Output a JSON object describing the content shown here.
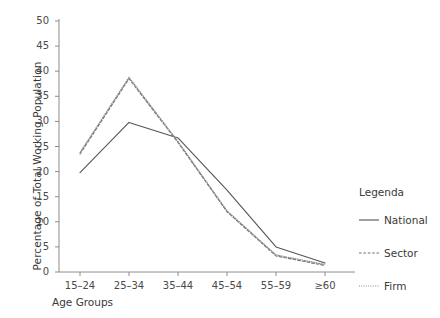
{
  "chart_data": {
    "type": "line",
    "title": "",
    "xlabel": "Age Groups",
    "ylabel": "Percentage of Total Working Population",
    "categories": [
      "15–24",
      "25–34",
      "35–44",
      "45–54",
      "55–59",
      "≥60"
    ],
    "ylim": [
      0,
      50
    ],
    "yticks": [
      0,
      5,
      10,
      15,
      20,
      25,
      30,
      35,
      40,
      45,
      50
    ],
    "ytick_labels": [
      "0",
      "5",
      "10",
      "15",
      "20",
      "25",
      "30",
      "35",
      "40",
      "45",
      "50"
    ],
    "grid": false,
    "legend_position": "right",
    "series": [
      {
        "name": "National",
        "style": "solid",
        "color": "#555555",
        "values": [
          19.8,
          29.8,
          26.7,
          16.3,
          5.0,
          1.8
        ]
      },
      {
        "name": "Sector",
        "style": "dashed",
        "color": "#6e6e6e",
        "values": [
          23.5,
          38.5,
          25.8,
          12.0,
          3.2,
          1.3
        ]
      },
      {
        "name": "Firm",
        "style": "dotted",
        "color": "#8a8a8a",
        "values": [
          23.8,
          38.8,
          26.0,
          12.2,
          3.4,
          1.5
        ]
      }
    ]
  },
  "legend": {
    "title": "Legenda",
    "entries": [
      {
        "label": "National"
      },
      {
        "label": "Sector"
      },
      {
        "label": "Firm"
      }
    ]
  },
  "axis": {
    "axis_color": "#8c8c8c"
  }
}
